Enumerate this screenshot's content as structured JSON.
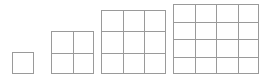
{
  "canvas": {
    "width": 269,
    "height": 78,
    "background_color": "#ffffff",
    "line_color": "#9a9a9a",
    "line_width": 1
  },
  "diagram": {
    "type": "square-number-growth-sequence",
    "cell_size": 21.5,
    "baseline_y": 74,
    "figures": [
      {
        "index": 1,
        "side_cells": 1,
        "cell_count": 1,
        "left": 12,
        "top": 52,
        "width": 22,
        "height": 22
      },
      {
        "index": 2,
        "side_cells": 2,
        "cell_count": 4,
        "left": 51,
        "top": 31,
        "width": 43,
        "height": 43
      },
      {
        "index": 3,
        "side_cells": 3,
        "cell_count": 9,
        "left": 101,
        "top": 10,
        "width": 65,
        "height": 64
      },
      {
        "index": 4,
        "side_cells": 4,
        "cell_count": 16,
        "left": 173,
        "top": 4,
        "width": 86,
        "height": 70
      }
    ]
  }
}
